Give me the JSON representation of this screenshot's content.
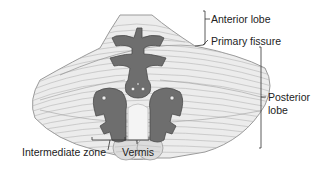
{
  "figure": {
    "colors": {
      "background": "#ffffff",
      "cortex_fill": "#ececec",
      "folia_lines": "#b5b5b5",
      "outline": "#9a9a9a",
      "nuclei_fill": "#6e6e6e",
      "nuclei_outline": "#4a4a4a",
      "tonsil_fill": "#dcdcdc",
      "leader_lines": "#333333",
      "text": "#222222"
    }
  },
  "labels": {
    "anterior_lobe": "Anterior lobe",
    "primary_fissure": "Primary fissure",
    "posterior_lobe_line1": "Posterior",
    "posterior_lobe_line2": "lobe",
    "intermediate_zone": "Intermediate zone",
    "vermis": "Vermis"
  }
}
